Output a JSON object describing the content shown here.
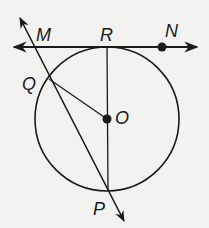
{
  "diagram": {
    "type": "geometry-circle-tangent-secant",
    "colors": {
      "background": "#f2f2f0",
      "stroke": "#1a1a1a"
    },
    "circle": {
      "center_label": "O",
      "cx": 107,
      "cy": 119,
      "r": 72
    },
    "labels": {
      "M": "M",
      "R": "R",
      "N": "N",
      "Q": "Q",
      "O": "O",
      "P": "P"
    },
    "tangent_line": {
      "through": [
        "R",
        "N"
      ],
      "arrows": "both"
    },
    "secant_ray": {
      "through": [
        "M",
        "Q",
        "P"
      ],
      "arrows": "both"
    },
    "segments": [
      {
        "from": "R",
        "to": "P",
        "note": "diameter through O"
      },
      {
        "from": "Q",
        "to": "O",
        "note": "radius"
      }
    ],
    "points": [
      {
        "name": "N",
        "dot": true
      },
      {
        "name": "O",
        "dot": true
      }
    ]
  }
}
